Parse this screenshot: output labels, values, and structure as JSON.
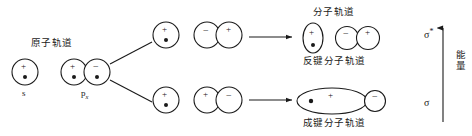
{
  "figure": {
    "title_atomic": "原子轨道",
    "title_molecular": "分子轨道",
    "label_antibonding": "反键分子轨道",
    "label_bonding": "成键分子轨道",
    "label_energy": "能量",
    "label_s": "s",
    "label_px_base": "p",
    "label_px_sub": "x",
    "sigma_star_base": "σ",
    "sigma_star_sup": "*",
    "sigma_base": "σ",
    "stroke_color": "#1a1a1a",
    "text_color": "#1a1a1a",
    "background": "#ffffff"
  },
  "orbitals": {
    "atomic_s": {
      "sign": "+",
      "has_electron_dot": true
    },
    "atomic_p_lobe_positive": {
      "sign": "+",
      "has_electron_dot": true
    },
    "atomic_p_lobe_negative": {
      "sign": "−",
      "has_electron_dot": true
    },
    "upper_single": {
      "sign": "+",
      "has_electron_dot": true
    },
    "upper_pair_left": {
      "sign": "−",
      "has_electron_dot": false
    },
    "upper_pair_right": {
      "sign": "+",
      "has_electron_dot": false
    },
    "lower_single": {
      "sign": "+",
      "has_electron_dot": true
    },
    "lower_pair_left": {
      "sign": "+",
      "has_electron_dot": false
    },
    "lower_pair_right": {
      "sign": "−",
      "has_electron_dot": false
    },
    "mo_antibonding_major": {
      "sign": "+",
      "has_electron_dot": true
    },
    "mo_antibonding_pair_left": {
      "sign": "−",
      "has_electron_dot": false
    },
    "mo_antibonding_pair_right": {
      "sign": "+",
      "has_electron_dot": false
    },
    "mo_bonding_major": {
      "sign": "+",
      "has_electron_dot": true
    },
    "mo_bonding_minor": {
      "sign": "−",
      "has_electron_dot": false
    }
  }
}
